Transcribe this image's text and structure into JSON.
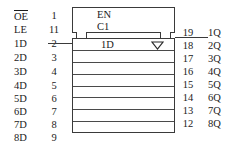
{
  "symbol": {
    "control_block": {
      "enable_label": "EN",
      "control_label": "C1"
    },
    "cell_label": "1D",
    "triangle_icon": "open-down-triangle"
  },
  "inputs": [
    {
      "signal": "OE",
      "overbar": true,
      "pin": "1"
    },
    {
      "signal": "LE",
      "overbar": false,
      "pin": "11"
    },
    {
      "signal": "1D",
      "overbar": false,
      "pin": "2"
    },
    {
      "signal": "2D",
      "overbar": false,
      "pin": "3"
    },
    {
      "signal": "3D",
      "overbar": false,
      "pin": "4"
    },
    {
      "signal": "4D",
      "overbar": false,
      "pin": "5"
    },
    {
      "signal": "5D",
      "overbar": false,
      "pin": "6"
    },
    {
      "signal": "6D",
      "overbar": false,
      "pin": "7"
    },
    {
      "signal": "7D",
      "overbar": false,
      "pin": "8"
    },
    {
      "signal": "8D",
      "overbar": false,
      "pin": "9"
    }
  ],
  "outputs": [
    {
      "pin": "19",
      "signal": "1Q"
    },
    {
      "pin": "18",
      "signal": "2Q"
    },
    {
      "pin": "17",
      "signal": "3Q"
    },
    {
      "pin": "16",
      "signal": "4Q"
    },
    {
      "pin": "15",
      "signal": "5Q"
    },
    {
      "pin": "14",
      "signal": "6Q"
    },
    {
      "pin": "13",
      "signal": "7Q"
    },
    {
      "pin": "12",
      "signal": "8Q"
    }
  ],
  "colors": {
    "line": "#3a3a3a",
    "inner_line": "#4a4a4a",
    "text": "#1b1b1b",
    "background": "#ffffff"
  }
}
